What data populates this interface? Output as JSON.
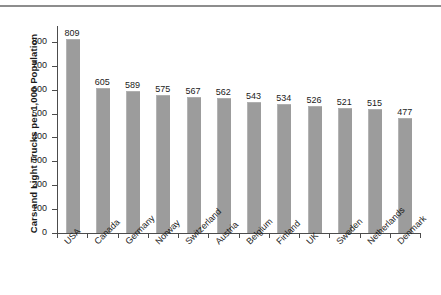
{
  "chart_data": {
    "type": "bar",
    "title": "",
    "xlabel": "",
    "ylabel": "Cars and Light Trucks per 1,000 Population",
    "ylim": [
      0,
      850
    ],
    "ytick_labels": [
      "0",
      "100",
      "200",
      "300",
      "400",
      "500",
      "600",
      "700",
      "800"
    ],
    "yticks": [
      0,
      100,
      200,
      300,
      400,
      500,
      600,
      700,
      800
    ],
    "grid": false,
    "legend": false,
    "bar_color": "#9c9c9c",
    "categories": [
      "USA",
      "Canada",
      "Germany",
      "Norway",
      "Switzerland",
      "Austria",
      "Belgium",
      "Finland",
      "UK",
      "Sweden",
      "Netherlands",
      "Denmark"
    ],
    "values": [
      809,
      605,
      589,
      575,
      567,
      562,
      543,
      534,
      526,
      521,
      515,
      477
    ],
    "value_labels": [
      "809",
      "605",
      "589",
      "575",
      "567",
      "562",
      "543",
      "534",
      "526",
      "521",
      "515",
      "477"
    ]
  }
}
